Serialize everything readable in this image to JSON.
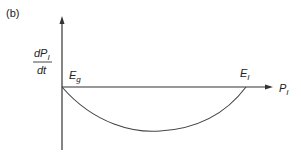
{
  "figure": {
    "panel_label": "(b)",
    "y_axis": {
      "label_numerator": "dP",
      "label_numerator_sub": "I",
      "label_denominator": "dt"
    },
    "x_axis": {
      "label": "P",
      "label_sub": "I"
    },
    "points": [
      {
        "label": "E",
        "sub": "g",
        "position": "origin"
      },
      {
        "label": "E",
        "sub": "I",
        "position": "right-root"
      }
    ],
    "curve": {
      "description": "parabola-like curve below x-axis between E_g and E_I",
      "start_x": 62,
      "end_x": 246,
      "axis_y": 87,
      "min_y": 131
    },
    "colors": {
      "axis": "#333333",
      "curve": "#444444",
      "text": "#222222"
    }
  }
}
